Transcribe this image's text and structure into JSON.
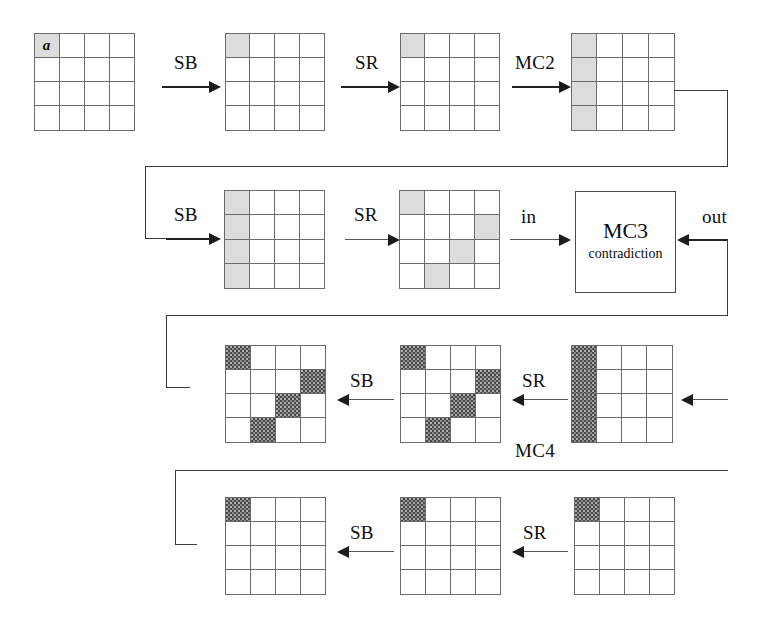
{
  "figure": {
    "type": "cipher-state-propagation-diagram",
    "grid_size": 4,
    "cell_fill_legend": {
      "light": "#dcdcdc",
      "dark": "#4a4a4a",
      "empty": "#ffffff"
    },
    "marker_glyph": "a"
  },
  "rows": [
    {
      "id": "row-1",
      "steps": [
        {
          "grid_id": "grid-r1-1",
          "label": "",
          "marker": {
            "row": 0,
            "col": 0,
            "text": "a"
          },
          "light_cells": [
            [
              0,
              0
            ]
          ],
          "dark_cells": []
        },
        {
          "arrow_label": "SB",
          "grid_id": "grid-r1-2",
          "light_cells": [
            [
              0,
              0
            ]
          ],
          "dark_cells": []
        },
        {
          "arrow_label": "SR",
          "grid_id": "grid-r1-3",
          "light_cells": [
            [
              0,
              0
            ]
          ],
          "dark_cells": []
        },
        {
          "arrow_label": "MC2",
          "grid_id": "grid-r1-4",
          "light_cells": [
            [
              0,
              0
            ],
            [
              1,
              0
            ],
            [
              2,
              0
            ],
            [
              3,
              0
            ]
          ],
          "dark_cells": []
        }
      ]
    },
    {
      "id": "row-2",
      "steps": [
        {
          "arrow_label": "SB",
          "grid_id": "grid-r2-1",
          "light_cells": [
            [
              0,
              0
            ],
            [
              1,
              0
            ],
            [
              2,
              0
            ],
            [
              3,
              0
            ]
          ],
          "dark_cells": []
        },
        {
          "arrow_label": "SR",
          "grid_id": "grid-r2-2",
          "light_cells": [
            [
              0,
              0
            ],
            [
              1,
              3
            ],
            [
              2,
              2
            ],
            [
              3,
              1
            ]
          ],
          "dark_cells": []
        },
        {
          "arrow_label": "in",
          "box": {
            "id": "mc3-box",
            "title": "MC3",
            "subtitle": "contradiction"
          },
          "return_label": "out"
        }
      ]
    },
    {
      "id": "row-3",
      "label": "MC4",
      "steps": [
        {
          "grid_id": "grid-r3-1",
          "light_cells": [],
          "dark_cells": [
            [
              0,
              0
            ],
            [
              1,
              3
            ],
            [
              2,
              2
            ],
            [
              3,
              1
            ]
          ]
        },
        {
          "arrow_label": "SB",
          "grid_id": "grid-r3-2",
          "light_cells": [],
          "dark_cells": [
            [
              0,
              0
            ],
            [
              1,
              3
            ],
            [
              2,
              2
            ],
            [
              3,
              1
            ]
          ]
        },
        {
          "arrow_label": "SR",
          "grid_id": "grid-r3-3",
          "light_cells": [],
          "dark_cells": [
            [
              0,
              0
            ],
            [
              1,
              0
            ],
            [
              2,
              0
            ],
            [
              3,
              0
            ]
          ]
        }
      ]
    },
    {
      "id": "row-4",
      "steps": [
        {
          "grid_id": "grid-r4-1",
          "light_cells": [],
          "dark_cells": [
            [
              0,
              0
            ]
          ]
        },
        {
          "arrow_label": "SB",
          "grid_id": "grid-r4-2",
          "light_cells": [],
          "dark_cells": [
            [
              0,
              0
            ]
          ]
        },
        {
          "arrow_label": "SR",
          "grid_id": "grid-r4-3",
          "light_cells": [],
          "dark_cells": [
            [
              0,
              0
            ]
          ]
        }
      ]
    }
  ],
  "labels": {
    "sb_1": "SB",
    "sr_1": "SR",
    "mc2": "MC2",
    "sb_2": "SB",
    "sr_2": "SR",
    "in": "in",
    "out": "out",
    "mc3_title": "MC3",
    "mc3_subtitle": "contradiction",
    "sb_3": "SB",
    "sr_3": "SR",
    "mc4": "MC4",
    "sb_4": "SB",
    "sr_4": "SR",
    "marker_a": "a"
  }
}
